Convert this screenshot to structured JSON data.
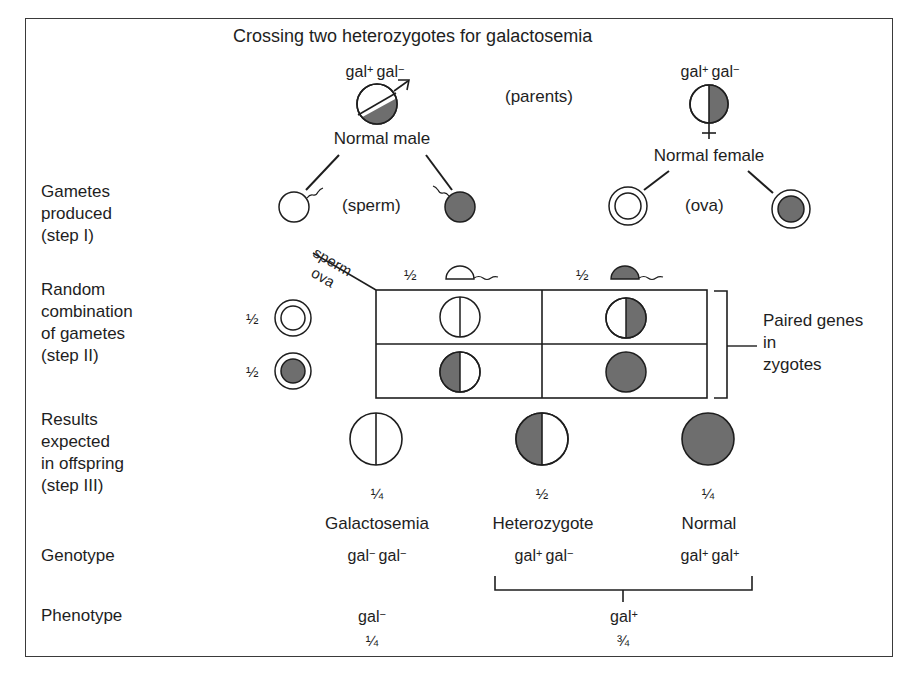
{
  "title": "Crossing two heterozygotes for galactosemia",
  "parents": {
    "label": "(parents)",
    "male": {
      "genotype_a": "gal",
      "sup_a": "+",
      "genotype_b": "gal",
      "sup_b": "−",
      "label": "Normal male",
      "symbol": "male-symbol"
    },
    "female": {
      "genotype_a": "gal",
      "sup_a": "+",
      "genotype_b": "gal",
      "sup_b": "−",
      "label": "Normal female",
      "symbol": "female-symbol"
    }
  },
  "row_labels": {
    "gametes": [
      "Gametes",
      "produced",
      "(step I)"
    ],
    "combination": [
      "Random",
      "combination",
      "of gametes",
      "(step II)"
    ],
    "results": [
      "Results",
      "expected",
      "in offspring",
      "(step III)"
    ],
    "genotype": "Genotype",
    "phenotype": "Phenotype"
  },
  "gametes": {
    "sperm_label": "(sperm)",
    "ova_label": "(ova)"
  },
  "punnett": {
    "corner_top": "sperm",
    "corner_bottom": "ova",
    "sperm_fractions": [
      "½",
      "½"
    ],
    "ova_fractions": [
      "½",
      "½"
    ],
    "cells": [
      [
        "white-white",
        "white-gray"
      ],
      [
        "gray-white",
        "gray-gray"
      ]
    ],
    "bracket_label": [
      "Paired genes",
      "in",
      "zygotes"
    ]
  },
  "offspring": [
    {
      "fraction": "¼",
      "name": "Galactosemia",
      "genotype_a": "gal",
      "sup_a": "−",
      "genotype_b": "gal",
      "sup_b": "−"
    },
    {
      "fraction": "½",
      "name": "Heterozygote",
      "genotype_a": "gal",
      "sup_a": "+",
      "genotype_b": "gal",
      "sup_b": "−"
    },
    {
      "fraction": "¼",
      "name": "Normal",
      "genotype_a": "gal",
      "sup_a": "+",
      "genotype_b": "gal",
      "sup_b": "+"
    }
  ],
  "phenotypes": [
    {
      "base": "gal",
      "sup": "−",
      "fraction": "¼"
    },
    {
      "base": "gal",
      "sup": "+",
      "fraction": "¾"
    }
  ],
  "colors": {
    "fill": "#6e6e6e",
    "stroke": "#1e1e1e",
    "border": "#3a3a3a"
  }
}
